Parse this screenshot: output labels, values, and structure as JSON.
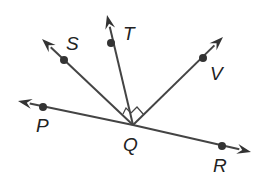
{
  "diagram": {
    "vertex": {
      "label": "Q",
      "x": 133,
      "y": 125,
      "label_x": 123,
      "label_y": 151
    },
    "rays": [
      {
        "name": "QP",
        "point": "P",
        "tip": [
          18,
          101
        ],
        "dot": [
          43,
          107
        ],
        "label": "P",
        "label_x": 36,
        "label_y": 132
      },
      {
        "name": "QS",
        "point": "S",
        "tip": [
          42,
          39
        ],
        "dot": [
          64,
          60
        ],
        "label": "S",
        "label_x": 66,
        "label_y": 50
      },
      {
        "name": "QT",
        "point": "T",
        "tip": [
          107,
          15
        ],
        "dot": [
          111,
          43
        ],
        "label": "T",
        "label_x": 123,
        "label_y": 40
      },
      {
        "name": "QV",
        "point": "V",
        "tip": [
          223,
          37
        ],
        "dot": [
          203,
          58
        ],
        "label": "V",
        "label_x": 210,
        "label_y": 80
      },
      {
        "name": "QR",
        "point": "R",
        "tip": [
          251,
          152
        ],
        "dot": [
          222,
          146
        ],
        "label": "R",
        "label_x": 213,
        "label_y": 172
      }
    ],
    "right_angles": [
      "SQT",
      "TQV"
    ],
    "colors": {
      "line": "#444444",
      "text": "#222222",
      "background": "#ffffff"
    }
  }
}
